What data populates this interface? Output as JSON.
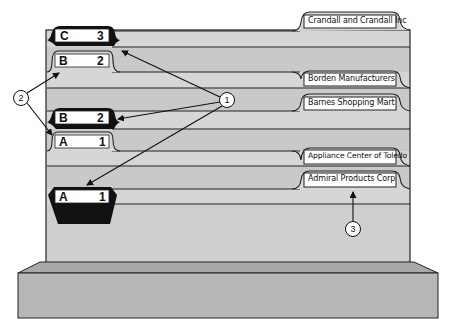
{
  "diagram": {
    "colors": {
      "panel": "#d6d6d6",
      "panel_dark": "#c4c4c4",
      "base": "#b5b5b5",
      "base_top": "#a8a8a8",
      "line": "#222222",
      "guide_black": "#111111",
      "label_bg": "#ffffff"
    },
    "folder_tabs": [
      {
        "label": "Crandall and Crandall Inc"
      },
      {
        "label": "Borden Manufacturers"
      },
      {
        "label": "Barnes Shopping Mart"
      },
      {
        "label": "Appliance Center of Toledo"
      },
      {
        "label": "Admiral Products Corp"
      }
    ],
    "primary_guides": [
      {
        "letter": "C",
        "number": "3"
      },
      {
        "letter": "B",
        "number": "2"
      },
      {
        "letter": "A",
        "number": "1"
      }
    ],
    "special_guides": [
      {
        "letter": "B",
        "number": "2"
      },
      {
        "letter": "A",
        "number": "1"
      }
    ],
    "callouts": [
      {
        "number": "1"
      },
      {
        "number": "2"
      },
      {
        "number": "3"
      }
    ]
  }
}
